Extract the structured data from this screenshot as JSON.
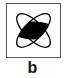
{
  "figure": {
    "panel_label": "b",
    "symbol": "four-petal-crossed-ellipses-icon",
    "colors": {
      "border": "#555555",
      "stroke": "#000000",
      "fill_center": "#000000",
      "background": "#ffffff"
    }
  }
}
